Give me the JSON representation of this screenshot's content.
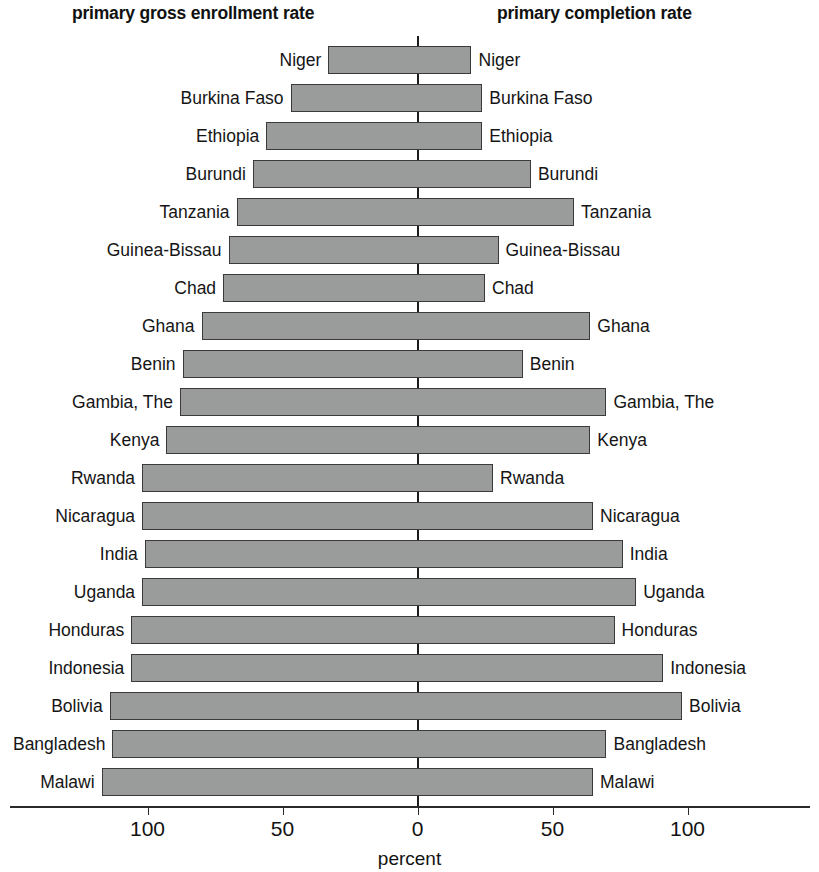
{
  "header": {
    "left_title": "primary gross enrollment rate",
    "right_title": "primary completion rate"
  },
  "axis": {
    "title": "percent",
    "tick_labels": [
      "100",
      "50",
      "0",
      "50",
      "100"
    ]
  },
  "colors": {
    "bar_fill": "#9a9b9b",
    "bar_border": "#3a3a3a",
    "axis": "#2a2a2a",
    "text": "#151515"
  },
  "chart_data": {
    "type": "bar",
    "title": "",
    "subtitle": "",
    "orientation": "horizontal",
    "style": "back-to-back population-pyramid style paired bars",
    "xlabel": "percent",
    "ylabel": "",
    "xlim": [
      -130,
      130
    ],
    "xticks": [
      -100,
      -50,
      0,
      50,
      100
    ],
    "xtick_labels": [
      "100",
      "50",
      "0",
      "50",
      "100"
    ],
    "grid": false,
    "legend": "none",
    "categories": [
      "Niger",
      "Burkina Faso",
      "Ethiopia",
      "Burundi",
      "Tanzania",
      "Guinea-Bissau",
      "Chad",
      "Ghana",
      "Benin",
      "Gambia, The",
      "Kenya",
      "Rwanda",
      "Nicaragua",
      "India",
      "Uganda",
      "Honduras",
      "Indonesia",
      "Bolivia",
      "Bangladesh",
      "Malawi"
    ],
    "series": [
      {
        "name": "primary gross enrollment rate",
        "side": "left",
        "values": [
          33,
          47,
          56,
          61,
          67,
          70,
          72,
          80,
          87,
          88,
          93,
          102,
          102,
          101,
          102,
          106,
          106,
          114,
          113,
          117
        ]
      },
      {
        "name": "primary completion rate",
        "side": "right",
        "values": [
          20,
          24,
          24,
          42,
          58,
          30,
          25,
          64,
          39,
          70,
          64,
          28,
          65,
          76,
          81,
          73,
          91,
          98,
          70,
          65
        ]
      }
    ]
  }
}
